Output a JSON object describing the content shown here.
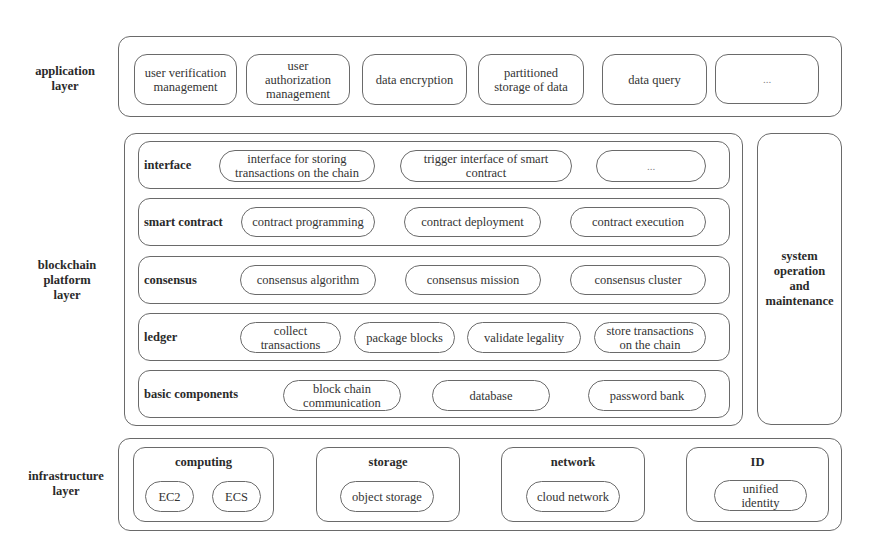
{
  "application_layer": {
    "label": "application\nlayer",
    "items": [
      {
        "text": "user verification\nmanagement"
      },
      {
        "text": "user\nauthorization\nmanagement"
      },
      {
        "text": "data encryption"
      },
      {
        "text": "partitioned\nstorage of data"
      },
      {
        "text": "data query"
      },
      {
        "text": "..."
      }
    ]
  },
  "blockchain_platform_layer": {
    "label": "blockchain\nplatform\nlayer",
    "rows": [
      {
        "label": "interface",
        "items": [
          "interface for storing\ntransactions on the chain",
          "trigger interface of smart\ncontract",
          "..."
        ]
      },
      {
        "label": "smart contract",
        "items": [
          "contract programming",
          "contract deployment",
          "contract execution"
        ]
      },
      {
        "label": "consensus",
        "items": [
          "consensus algorithm",
          "consensus mission",
          "consensus cluster"
        ]
      },
      {
        "label": "ledger",
        "items": [
          "collect\ntransactions",
          "package blocks",
          "validate legality",
          "store transactions\non the chain"
        ]
      },
      {
        "label": "basic components",
        "items": [
          "block chain\ncommunication",
          "database",
          "password bank"
        ]
      }
    ]
  },
  "system_operation": {
    "label": "system\noperation\nand\nmaintenance"
  },
  "infrastructure_layer": {
    "label": "infrastructure\nlayer",
    "groups": [
      {
        "title": "computing",
        "items": [
          "EC2",
          "ECS"
        ]
      },
      {
        "title": "storage",
        "items": [
          "object storage"
        ]
      },
      {
        "title": "network",
        "items": [
          "cloud network"
        ]
      },
      {
        "title": "ID",
        "items": [
          "unified\nidentity"
        ]
      }
    ]
  }
}
